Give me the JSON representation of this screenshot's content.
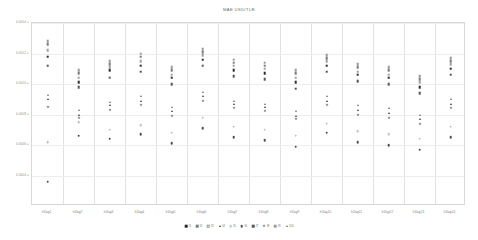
{
  "chart_data": {
    "type": "scatter",
    "title": "MAE USD/TLR",
    "xlabel": "",
    "ylabel": "",
    "grid": true,
    "legend_position": "bottom",
    "ylim": [
      0.0002,
      0.0014
    ],
    "yticks": [
      "0.0014",
      "0.0012",
      "0.0010",
      "0.0008",
      "0.0006",
      "0.0004"
    ],
    "categories": [
      "h1lag1",
      "h1lag2",
      "h1lag3",
      "h1lag4",
      "h1lag5",
      "h1lag6",
      "h1lag7",
      "h1lag8",
      "h1lag9",
      "h1lag10",
      "h1lag11",
      "h1lag12",
      "h1lag13",
      "h1lag14"
    ],
    "series": [
      {
        "name": "l1",
        "marker": "square",
        "color": "#2b2b2b",
        "values": [
          0.00118,
          0.00101,
          0.00109,
          0.00112,
          0.00104,
          0.00116,
          0.00109,
          0.00107,
          0.00101,
          0.00112,
          0.00106,
          0.00104,
          0.00098,
          0.0011
        ]
      },
      {
        "name": "l2",
        "marker": "square",
        "color": "#7a7a7a",
        "values": [
          0.00126,
          0.00107,
          0.00113,
          0.00118,
          0.00109,
          0.00121,
          0.00114,
          0.00112,
          0.00107,
          0.00117,
          0.00111,
          0.00109,
          0.00103,
          0.00115
        ]
      },
      {
        "name": "l3",
        "marker": "square-open",
        "color": "#9a9a9a",
        "values": [
          0.00128,
          0.00109,
          0.00115,
          0.0012,
          0.00111,
          0.00123,
          0.00116,
          0.00114,
          0.00109,
          0.00119,
          0.00113,
          0.00111,
          0.00105,
          0.00117
        ]
      },
      {
        "name": "l4",
        "marker": "triangle",
        "color": "#3a3a3a",
        "values": [
          0.0009,
          0.0008,
          0.00086,
          0.00089,
          0.00082,
          0.00092,
          0.00087,
          0.00085,
          0.00079,
          0.00089,
          0.00083,
          0.00081,
          0.00077,
          0.00087
        ]
      },
      {
        "name": "l5",
        "marker": "circle-open",
        "color": "#b0b0b0",
        "values": [
          0.00062,
          0.00075,
          0.0007,
          0.00073,
          0.00068,
          0.00078,
          0.00072,
          0.0007,
          0.00066,
          0.00074,
          0.00069,
          0.00067,
          0.00064,
          0.00072
        ]
      },
      {
        "name": "l6",
        "marker": "circle",
        "color": "#4a4a4a",
        "values": [
          0.00036,
          0.00066,
          0.00064,
          0.00067,
          0.00061,
          0.00071,
          0.00065,
          0.00063,
          0.00059,
          0.00068,
          0.00062,
          0.0006,
          0.00057,
          0.00065
        ]
      },
      {
        "name": "l7",
        "marker": "square",
        "color": "#555555",
        "values": [
          0.00112,
          0.00098,
          0.00104,
          0.00108,
          0.001,
          0.00112,
          0.00105,
          0.00103,
          0.00097,
          0.00108,
          0.00102,
          0.001,
          0.00094,
          0.00106
        ]
      },
      {
        "name": "l8",
        "marker": "diamond",
        "color": "#8e8e8e",
        "values": [
          0.00085,
          0.00078,
          0.00083,
          0.00086,
          0.00079,
          0.00089,
          0.00084,
          0.00082,
          0.00077,
          0.00086,
          0.0008,
          0.00078,
          0.00074,
          0.00084
        ]
      },
      {
        "name": "l9",
        "marker": "square",
        "color": "#9f9f9f",
        "values": [
          0.00122,
          0.00104,
          0.00111,
          0.00115,
          0.00106,
          0.00119,
          0.00112,
          0.0011,
          0.00104,
          0.00115,
          0.00108,
          0.00106,
          0.00101,
          0.00113
        ]
      },
      {
        "name": "l10",
        "marker": "triangle",
        "color": "#6d6d6d",
        "values": [
          0.00093,
          0.00083,
          0.00088,
          0.00092,
          0.00085,
          0.00095,
          0.00089,
          0.00087,
          0.00082,
          0.00092,
          0.00086,
          0.00084,
          0.0008,
          0.0009
        ]
      }
    ]
  }
}
